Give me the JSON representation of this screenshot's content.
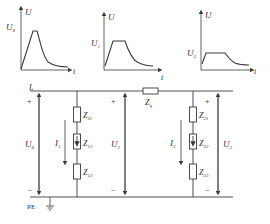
{
  "colors": {
    "line": "#3a3a3a",
    "background": "#ffffff",
    "text": "#333333"
  },
  "graphs": [
    {
      "y_axis": "U",
      "x_axis": "t",
      "level_label": "U",
      "level_sub": "0",
      "shape": "peak"
    },
    {
      "y_axis": "U",
      "x_axis": "t",
      "level_label": "U",
      "level_sub": "1",
      "shape": "plateau"
    },
    {
      "y_axis": "U",
      "x_axis": "t",
      "level_label": "U",
      "level_sub": "2",
      "shape": "long-plateau"
    }
  ],
  "circuit": {
    "line_label": "L",
    "pe_label": "PE",
    "plus": "+",
    "minus": "−",
    "series_impedance": {
      "label": "Z",
      "sub": "q"
    },
    "voltages": [
      {
        "label": "U",
        "sub": "0"
      },
      {
        "label": "U",
        "sub": "1"
      },
      {
        "label": "U",
        "sub": "2"
      }
    ],
    "branch1": {
      "current": {
        "label": "I",
        "sub": "1"
      },
      "impedances": [
        {
          "label": "Z",
          "sub": "11"
        },
        {
          "label": "Z",
          "sub": "12"
        },
        {
          "label": "Z",
          "sub": "13"
        }
      ]
    },
    "branch2": {
      "current": {
        "label": "I",
        "sub": "2"
      },
      "impedances": [
        {
          "label": "Z",
          "sub": "21"
        },
        {
          "label": "Z",
          "sub": "22"
        },
        {
          "label": "Z",
          "sub": "23"
        }
      ]
    }
  }
}
